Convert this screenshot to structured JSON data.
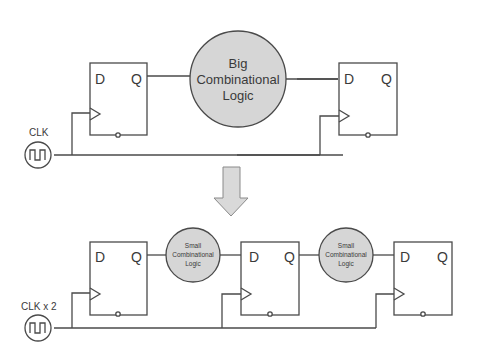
{
  "diagram": {
    "colors": {
      "line": "#4a4a4a",
      "logic_fill": "#d6d6d6",
      "ff_fill": "#ffffff",
      "arrow_fill": "#d9d9d9",
      "text": "#3a3a3a"
    },
    "top": {
      "clock_label": "CLK",
      "ff_left": {
        "d": "D",
        "q": "Q"
      },
      "logic": {
        "line1": "Big",
        "line2": "Combinational",
        "line3": "Logic"
      },
      "ff_right": {
        "d": "D",
        "q": "Q"
      }
    },
    "arrow": {
      "direction": "down"
    },
    "bottom": {
      "clock_label": "CLK x 2",
      "ff1": {
        "d": "D",
        "q": "Q"
      },
      "logic1": {
        "line1": "Small",
        "line2": "Combinational",
        "line3": "Logic"
      },
      "ff2": {
        "d": "D",
        "q": "Q"
      },
      "logic2": {
        "line1": "Small",
        "line2": "Combinational",
        "line3": "Logic"
      },
      "ff3": {
        "d": "D",
        "q": "Q"
      }
    }
  }
}
